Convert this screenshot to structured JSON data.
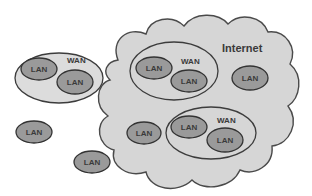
{
  "diagram": {
    "colors": {
      "background": "#ffffff",
      "cloud_fill": "#d6d6d6",
      "cloud_stroke": "#4a4a4a",
      "wan_fill": "#dcdcdc",
      "wan_stroke": "#3c3c3c",
      "lan_fill": "#9a9a9a",
      "lan_stroke": "#333333",
      "text": "#3a3a3a"
    },
    "internet": {
      "label": "Internet"
    },
    "standalone_wan": {
      "label": "WAN",
      "lans": [
        {
          "label": "LAN"
        },
        {
          "label": "LAN"
        }
      ]
    },
    "standalone_lans": [
      {
        "label": "LAN"
      },
      {
        "label": "LAN"
      }
    ],
    "internet_wan_upper": {
      "label": "WAN",
      "lans": [
        {
          "label": "LAN"
        },
        {
          "label": "LAN"
        }
      ]
    },
    "internet_wan_lower": {
      "label": "WAN",
      "lans": [
        {
          "label": "LAN"
        },
        {
          "label": "LAN"
        }
      ]
    },
    "internet_lans": [
      {
        "label": "LAN"
      },
      {
        "label": "LAN"
      }
    ]
  }
}
